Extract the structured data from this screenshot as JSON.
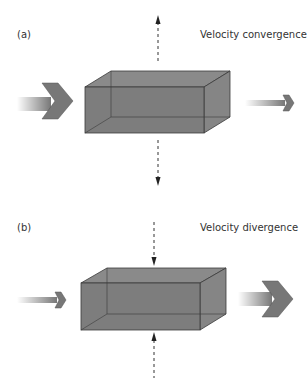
{
  "panels": [
    {
      "label": "(a)",
      "title": "Velocity convergence",
      "inflow": "large",
      "outflow": "small",
      "vertical": "outward"
    },
    {
      "label": "(b)",
      "title": "Velocity divergence",
      "inflow": "small",
      "outflow": "large",
      "vertical": "inward"
    }
  ],
  "colors": {
    "box_fill": "#7d7d7d",
    "box_edge": "#3a3a3a",
    "arrow_fill": "#777777",
    "dashed": "#333333",
    "text": "#333333"
  }
}
